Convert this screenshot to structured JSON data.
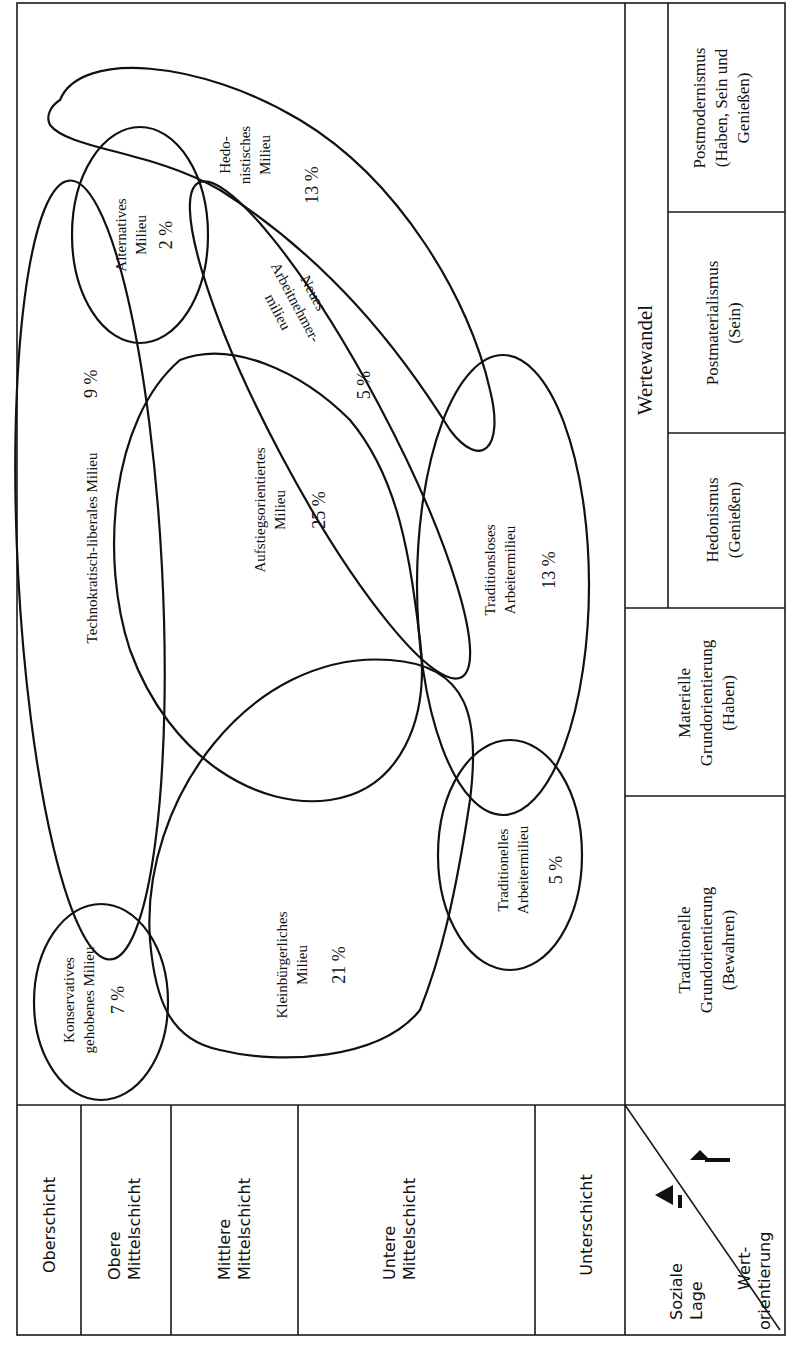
{
  "diagram": {
    "title": "Wertewandel",
    "orientation": "rotated-90-ccw",
    "social_axis": {
      "corner_label_line1": "Soziale",
      "corner_label_line2": "Lage",
      "value_label_line1": "Wert-",
      "value_label_line2": "orientierung",
      "classes": [
        {
          "label_line1": "Oberschicht",
          "label_line2": ""
        },
        {
          "label_line1": "Obere",
          "label_line2": "Mittelschicht"
        },
        {
          "label_line1": "Mittlere",
          "label_line2": "Mittelschicht"
        },
        {
          "label_line1": "Untere",
          "label_line2": "Mittelschicht"
        },
        {
          "label_line1": "Unterschicht",
          "label_line2": ""
        }
      ]
    },
    "value_axis": {
      "group_label": "Wertewandel",
      "orientations": [
        {
          "line1": "Traditionelle",
          "line2": "Grundorientierung",
          "line3": "(Bewahren)"
        },
        {
          "line1": "Materielle",
          "line2": "Grundorientierung",
          "line3": "(Haben)"
        },
        {
          "line1": "Hedonismus",
          "line2": "(Genießen)",
          "line3": ""
        },
        {
          "line1": "Postmaterialismus",
          "line2": "(Sein)",
          "line3": ""
        },
        {
          "line1": "Postmodernismus",
          "line2": "(Haben, Sein und",
          "line3": "Genießen)"
        }
      ]
    },
    "milieus": [
      {
        "name_line1": "Konservatives",
        "name_line2": "gehobenes Milieu",
        "share": "7 %"
      },
      {
        "name_line1": "Kleinbürgerliches",
        "name_line2": "Milieu",
        "share": "21 %"
      },
      {
        "name_line1": "Traditionelles",
        "name_line2": "Arbeitermilieu",
        "share": "5 %"
      },
      {
        "name_line1": "Technokratisch-liberales Milieu",
        "name_line2": "",
        "share": "9 %"
      },
      {
        "name_line1": "Aufstiegsorientiertes",
        "name_line2": "Milieu",
        "share": "25 %"
      },
      {
        "name_line1": "Traditionsloses",
        "name_line2": "Arbeitermilieu",
        "share": "13 %"
      },
      {
        "name_line1": "Neues",
        "name_line2": "Arbeitnehmer-",
        "name_line3": "milieu",
        "share": "5 %"
      },
      {
        "name_line1": "Alternatives",
        "name_line2": "Milieu",
        "share": "2 %"
      },
      {
        "name_line1": "Hedo-",
        "name_line2": "nistisches",
        "name_line3": "Milieu",
        "share": "13 %"
      }
    ]
  }
}
